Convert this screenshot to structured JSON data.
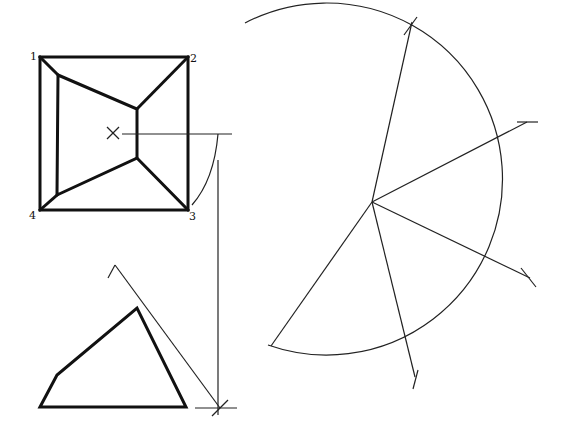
{
  "drawing": {
    "title": "Development of an oblique pyramid frustum",
    "colors": {
      "stroke": "#111111",
      "background": "#ffffff"
    },
    "plan_view": {
      "outer_square": {
        "corners": [
          [
            40,
            57
          ],
          [
            188,
            57
          ],
          [
            188,
            210
          ],
          [
            40,
            210
          ]
        ]
      },
      "labels": [
        {
          "text": "1",
          "x": 30,
          "y": 56
        },
        {
          "text": "2",
          "x": 190,
          "y": 60
        },
        {
          "text": "3",
          "x": 189,
          "y": 219
        },
        {
          "text": "4",
          "x": 29,
          "y": 218
        }
      ],
      "inner_polygon": [
        [
          58,
          75
        ],
        [
          137,
          109
        ],
        [
          137,
          158
        ],
        [
          57,
          195
        ]
      ],
      "corner_edges": [
        [
          [
            40,
            57
          ],
          [
            58,
            75
          ]
        ],
        [
          [
            188,
            57
          ],
          [
            137,
            109
          ]
        ],
        [
          [
            188,
            210
          ],
          [
            137,
            158
          ]
        ],
        [
          [
            40,
            210
          ],
          [
            57,
            195
          ]
        ]
      ],
      "center_mark": {
        "x": 113,
        "y": 133,
        "symbol": "×"
      },
      "projection_line": [
        [
          122,
          134
        ],
        [
          232,
          134
        ]
      ],
      "construction_arc": {
        "from": [
          218,
          134
        ],
        "to": [
          192,
          205
        ]
      }
    },
    "elevation_view": {
      "profile": [
        [
          40,
          407
        ],
        [
          57,
          375
        ],
        [
          137,
          308
        ],
        [
          186,
          407
        ]
      ],
      "true_length_line": [
        [
          115,
          265
        ],
        [
          220,
          408
        ]
      ],
      "apex_tick": [
        [
          108,
          278
        ],
        [
          115,
          265
        ]
      ],
      "vertical_line": [
        [
          218,
          160
        ],
        [
          218,
          415
        ]
      ],
      "base_cross": {
        "x": 220,
        "y": 408
      }
    },
    "development": {
      "apex": [
        372,
        202
      ],
      "radius": 176,
      "arc": {
        "start": [
          245,
          23
        ],
        "end": [
          268,
          345
        ]
      },
      "rays": [
        {
          "to": [
            412,
            22
          ],
          "tick": true
        },
        {
          "to": [
            527,
            122
          ],
          "tick": true
        },
        {
          "to": [
            530,
            278
          ],
          "tick": true
        },
        {
          "to": [
            415,
            377
          ],
          "tick": true
        },
        {
          "to": [
            271,
            346
          ],
          "tick": false
        }
      ]
    }
  }
}
